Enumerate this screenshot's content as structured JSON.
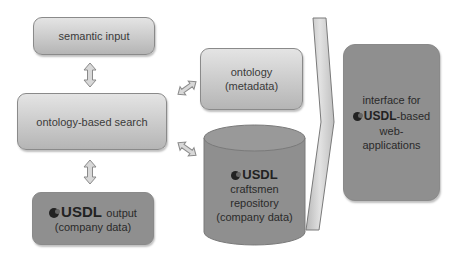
{
  "diagram": {
    "nodes": {
      "semantic_input": {
        "label": "semantic input"
      },
      "ontology_search": {
        "label": "ontology-based search"
      },
      "usdl_output": {
        "brand": "USDL",
        "label_suffix": "output",
        "line2": "(company data)"
      },
      "ontology": {
        "line1": "ontology",
        "line2": "(metadata)"
      },
      "repository": {
        "brand": "USDL",
        "line1": "craftsmen",
        "line2": "repository",
        "line3": "(company data)"
      },
      "interface": {
        "line1": "interface for",
        "brand": "USDL",
        "brand_suffix": "-based",
        "line3": "web-",
        "line4": "applications"
      }
    },
    "edges": [
      {
        "from": "semantic_input",
        "to": "ontology_search",
        "type": "bidirectional"
      },
      {
        "from": "ontology_search",
        "to": "usdl_output",
        "type": "bidirectional"
      },
      {
        "from": "ontology_search",
        "to": "ontology",
        "type": "bidirectional"
      },
      {
        "from": "ontology_search",
        "to": "repository",
        "type": "bidirectional"
      },
      {
        "from": "all",
        "to": "interface",
        "type": "chevron"
      }
    ],
    "colors": {
      "light_box": "#c8c8c8",
      "dark_box": "#8f8f8f",
      "border": "#8a8a8a",
      "arrow_fill": "#d8d8d8"
    }
  }
}
